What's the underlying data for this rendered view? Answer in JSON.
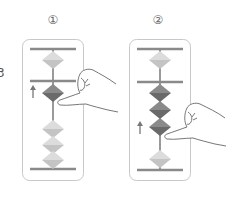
{
  "figure": {
    "side_label": "3",
    "colors": {
      "frame": "#c8c8c8",
      "bar": "#8a8a8a",
      "rod": "#9a9a9a",
      "bead_light": "#c9c9c9",
      "bead_light_top": "#dadada",
      "bead_dark": "#6e6e6e",
      "bead_dark_top": "#888888",
      "arrow": "#777777",
      "hand_fill": "#ffffff",
      "hand_stroke": "#777777"
    },
    "panels": [
      {
        "step": "①",
        "upper_beads": [
          {
            "state": "up",
            "shade": "light"
          }
        ],
        "lower_beads": [
          {
            "state": "moving-up",
            "shade": "dark"
          },
          {
            "state": "down",
            "shade": "light"
          },
          {
            "state": "down",
            "shade": "light"
          },
          {
            "state": "down",
            "shade": "light"
          }
        ],
        "arrow": "up",
        "action": "finger pushes bead up"
      },
      {
        "step": "②",
        "upper_beads": [
          {
            "state": "up",
            "shade": "light"
          }
        ],
        "lower_beads": [
          {
            "state": "up",
            "shade": "dark"
          },
          {
            "state": "up",
            "shade": "dark"
          },
          {
            "state": "moving-up",
            "shade": "dark"
          },
          {
            "state": "down",
            "shade": "light"
          }
        ],
        "arrow": "up",
        "action": "finger pushes bead up"
      }
    ]
  }
}
